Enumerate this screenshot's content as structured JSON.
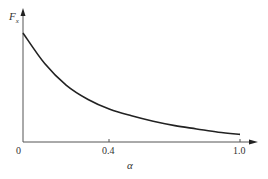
{
  "chart_data": {
    "type": "line",
    "title": "",
    "xlabel": "α",
    "ylabel": "F_x",
    "ylabel_main": "F",
    "ylabel_sub": "x",
    "x_ticks": [
      "0",
      "0.4",
      "1.0"
    ],
    "xlim": [
      0,
      1.0
    ],
    "grid": false,
    "legend": null,
    "series": [
      {
        "name": "F_x",
        "x": [
          0.0,
          0.1,
          0.2,
          0.3,
          0.4,
          0.5,
          0.6,
          0.7,
          0.8,
          0.9,
          1.0
        ],
        "values": [
          1.0,
          0.72,
          0.52,
          0.39,
          0.3,
          0.24,
          0.19,
          0.15,
          0.12,
          0.09,
          0.07
        ]
      }
    ],
    "color": "#222222"
  },
  "labels": {
    "origin": "0",
    "tick_04": "0.4",
    "tick_10": "1.0",
    "x_axis": "α",
    "y_axis_main": "F",
    "y_axis_sub": "x"
  }
}
